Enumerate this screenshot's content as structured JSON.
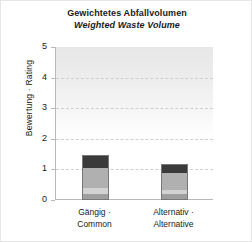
{
  "chart_data": {
    "type": "bar",
    "stacked": true,
    "title": "Gewichtetes Abfallvolumen",
    "subtitle": "Weighted Waste Volume",
    "xlabel": "",
    "ylabel": "Bewertung · Rating",
    "ylim": [
      0,
      5
    ],
    "yticks": [
      0,
      1,
      2,
      3,
      4,
      5
    ],
    "ytick_labels": [
      "0",
      "1",
      "2",
      "3",
      "4",
      "5"
    ],
    "grid": "horizontal-dashed",
    "legend": "none",
    "categories": [
      "Gängig ·\nCommon",
      "Alternativ ·\nAlternative"
    ],
    "category_labels": [
      {
        "line1": "Gängig ·",
        "line2": "Common"
      },
      {
        "line1": "Alternativ ·",
        "line2": "Alternative"
      }
    ],
    "series": [
      {
        "name": "segment-1",
        "color": "#9e9e9e",
        "values": [
          0.15,
          0.15
        ]
      },
      {
        "name": "segment-2",
        "color": "#d2d2d2",
        "values": [
          0.2,
          0.15
        ]
      },
      {
        "name": "segment-3",
        "color": "#b0b0b0",
        "values": [
          0.65,
          0.55
        ]
      },
      {
        "name": "segment-4",
        "color": "#3a3a3a",
        "values": [
          0.4,
          0.25
        ]
      }
    ],
    "totals": [
      1.4,
      1.1
    ],
    "bar_edge_color": "#777777",
    "axis_color": "#b8b8b8",
    "gridline_color": "#cfcfcf",
    "plot_background_top": "#e7e7e7",
    "plot_background_bottom": "#ffffff",
    "figure_border_color": "#e6e6e6"
  }
}
